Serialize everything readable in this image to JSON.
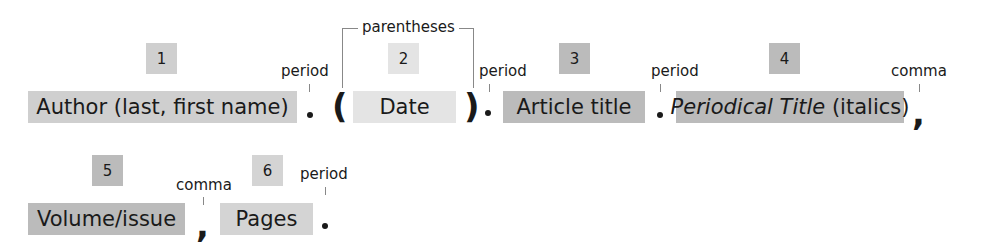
{
  "diagram": {
    "colors": {
      "dark": "#bbbbbb",
      "medium": "#cfcfcf",
      "light": "#e4e4e4",
      "light_medium": "#d4d4d4"
    },
    "elements": [
      {
        "number": "1",
        "label": "Author (last, first name)"
      },
      {
        "number": "2",
        "label": "Date"
      },
      {
        "number": "3",
        "label": "Article title"
      },
      {
        "number": "4",
        "label_italic": "Periodical Title",
        "label_rest": " (italics)"
      },
      {
        "number": "5",
        "label": "Volume/issue"
      },
      {
        "number": "6",
        "label": "Pages"
      }
    ],
    "punctuation_labels": {
      "p1": "period",
      "parentheses": "parentheses",
      "p2": "period",
      "p3": "period",
      "c1": "comma",
      "c2": "comma",
      "p4": "period"
    },
    "symbols": {
      "open_paren": "(",
      "close_paren": ")",
      "comma": ","
    }
  }
}
